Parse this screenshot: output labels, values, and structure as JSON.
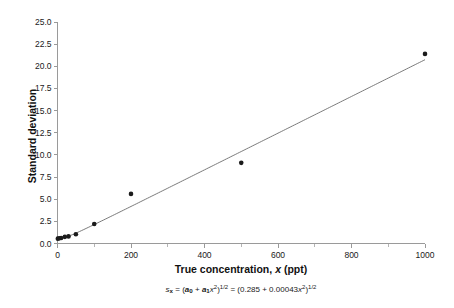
{
  "chart_data": {
    "type": "scatter",
    "title": "",
    "xlabel": "True concentration, x (ppt)",
    "ylabel": "Standard deviation",
    "xlim": [
      0,
      1000
    ],
    "ylim": [
      0.0,
      25.0
    ],
    "grid": false,
    "legend": "none",
    "x_ticks": [
      "0",
      "200",
      "400",
      "600",
      "800",
      "1000"
    ],
    "x_tick_values": [
      0,
      200,
      400,
      600,
      800,
      1000
    ],
    "x_minor_tick_values": [
      100,
      300,
      500,
      700,
      900
    ],
    "y_ticks": [
      "0.0",
      "2.5",
      "5.0",
      "7.5",
      "10.0",
      "12.5",
      "15.0",
      "17.5",
      "20.0",
      "22.5",
      "25.0"
    ],
    "y_tick_values": [
      0.0,
      2.5,
      5.0,
      7.5,
      10.0,
      12.5,
      15.0,
      17.5,
      20.0,
      22.5,
      25.0
    ],
    "series": [
      {
        "name": "Observed standard deviation",
        "marker": "filled-circle",
        "color": "#1b1b1b",
        "points": [
          {
            "x": 1,
            "y": 0.55
          },
          {
            "x": 5,
            "y": 0.6
          },
          {
            "x": 10,
            "y": 0.62
          },
          {
            "x": 20,
            "y": 0.75
          },
          {
            "x": 30,
            "y": 0.8
          },
          {
            "x": 50,
            "y": 1.05
          },
          {
            "x": 100,
            "y": 2.2
          },
          {
            "x": 200,
            "y": 5.6
          },
          {
            "x": 500,
            "y": 9.1
          },
          {
            "x": 1000,
            "y": 21.4
          }
        ]
      }
    ],
    "fit_curve": {
      "name": "Fitted model",
      "color": "#6b6b6b",
      "expression": "sqrt(0.285 + 0.00043*x^2)",
      "a0": 0.285,
      "a1": 0.00043
    },
    "annotations": {
      "equation_plain": "s_x = (a_0 + a_1 x^2)^(1/2) = (0.285 + 0.00043 x^2)^(1/2)",
      "equation_parts": {
        "lhs_symbol": "s",
        "lhs_subscript": "x",
        "equals": "=",
        "term_a0": "a",
        "term_a0_sub": "0",
        "term_a1": "a",
        "term_a1_sub": "1",
        "var": "x",
        "power": "2",
        "exponent": "1/2",
        "value_a0": "0.285",
        "value_a1": "0.00043"
      }
    }
  },
  "figure": {
    "caption": ""
  },
  "colors": {
    "axis": "#9a9a9a",
    "marker": "#1b1b1b",
    "fit_line": "#6b6b6b",
    "text": "#1a1a1a",
    "background": "#ffffff"
  }
}
